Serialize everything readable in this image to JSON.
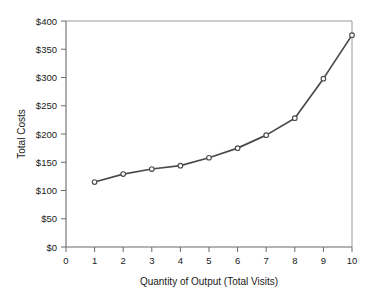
{
  "chart_data": {
    "type": "line",
    "title": "",
    "xlabel": "Quantity of Output (Total Visits)",
    "ylabel": "Total Costs",
    "x": [
      1,
      2,
      3,
      4,
      5,
      6,
      7,
      8,
      9,
      10
    ],
    "values": [
      115,
      129,
      138,
      144,
      158,
      175,
      198,
      228,
      298,
      375
    ],
    "series": [
      {
        "name": "Total Costs",
        "values": [
          115,
          129,
          138,
          144,
          158,
          175,
          198,
          228,
          298,
          375
        ]
      }
    ],
    "xlim": [
      0,
      10
    ],
    "ylim": [
      0,
      400
    ],
    "xticks": [
      0,
      1,
      2,
      3,
      4,
      5,
      6,
      7,
      8,
      9,
      10
    ],
    "xtick_labels": [
      "0",
      "1",
      "2",
      "3",
      "4",
      "5",
      "6",
      "7",
      "8",
      "9",
      "10"
    ],
    "yticks": [
      0,
      50,
      100,
      150,
      200,
      250,
      300,
      350,
      400
    ],
    "ytick_labels": [
      "$0",
      "$50",
      "$100",
      "$150",
      "$200",
      "$250",
      "$300",
      "$350",
      "$400"
    ],
    "grid": false,
    "legend": false,
    "legend_position": "none",
    "marker": "open-circle",
    "line_color": "#4a4a4a",
    "marker_fill": "#ffffff",
    "background_color": "#ffffff",
    "annotations": []
  }
}
